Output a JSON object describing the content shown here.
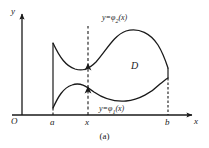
{
  "figure": {
    "caption": "(a)",
    "axes": {
      "origin_label": "O",
      "x_axis_label": "x",
      "y_axis_label": "y"
    },
    "ticks": [
      {
        "name": "a",
        "label": "a"
      },
      {
        "name": "x",
        "label": "x"
      },
      {
        "name": "b",
        "label": "b"
      }
    ],
    "region_label": "D",
    "curves": [
      {
        "name": "upper-boundary",
        "label_prefix": "y=",
        "label_fn": "φ",
        "label_sub": "2",
        "label_arg": "(x)"
      },
      {
        "name": "lower-boundary",
        "label_prefix": "y=",
        "label_fn": "φ",
        "label_sub": "1",
        "label_arg": "(x)"
      }
    ],
    "colors": {
      "ink": "#1a1a1a",
      "background": "#ffffff"
    }
  }
}
